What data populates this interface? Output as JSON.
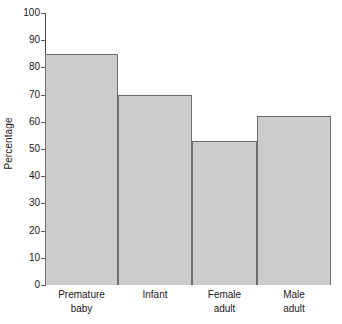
{
  "chart_data": {
    "type": "bar",
    "title": "",
    "xlabel": "",
    "ylabel": "Percentage",
    "categories": [
      "Premature baby",
      "Infant",
      "Female adult",
      "Male adult"
    ],
    "category_lines": [
      [
        "Premature",
        "baby"
      ],
      [
        "Infant",
        ""
      ],
      [
        "Female",
        "adult"
      ],
      [
        "Male",
        "adult"
      ]
    ],
    "values": [
      85,
      70,
      53,
      62
    ],
    "ylim": [
      0,
      100
    ],
    "ytick_values": [
      0,
      10,
      20,
      30,
      40,
      50,
      60,
      70,
      80,
      90,
      100
    ],
    "ytick_labels": [
      "0",
      "10",
      "20",
      "30",
      "40",
      "50",
      "60",
      "70",
      "80",
      "90",
      "100"
    ],
    "grid": false,
    "legend": "none",
    "bar_fill_color": "#cccccc",
    "bar_edge_color": "#6e6e6e",
    "axis_color": "#4a4a4a",
    "background_color": "#ffffff"
  }
}
